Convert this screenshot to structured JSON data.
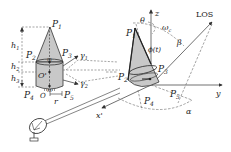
{
  "diagram": {
    "left_target": {
      "points": [
        "P1",
        "P2",
        "P3",
        "P4",
        "P5"
      ],
      "dimensions": [
        "h1",
        "h2",
        "h3",
        "r"
      ],
      "centers": [
        "O'",
        "O"
      ],
      "markers": [
        "m",
        "m"
      ],
      "scatter_directions": [
        "γ1",
        "γ2"
      ]
    },
    "right_target": {
      "points": [
        "P1",
        "P2",
        "P3",
        "P4",
        "P5"
      ],
      "angles": [
        "θ",
        "ω_c",
        "φ(t)",
        "β",
        "α"
      ],
      "axes": [
        "z",
        "y",
        "x'"
      ],
      "los_label": "LOS"
    },
    "labels": {
      "P1": "P",
      "P1_sub": "1",
      "P2": "P",
      "P2_sub": "2",
      "P3": "P",
      "P3_sub": "3",
      "P4": "P",
      "P4_sub": "4",
      "P5": "P",
      "P5_sub": "5",
      "h": "h",
      "h1_sub": "1",
      "h2_sub": "2",
      "h3_sub": "3",
      "r": "r",
      "O_prime": "O'",
      "O": "O",
      "m": "m",
      "gamma": "γ",
      "gamma1_sub": "1",
      "gamma2_sub": "2",
      "theta": "θ",
      "omega": "ω",
      "omega_sub": "c",
      "phi": "ϕ(t)",
      "beta": "β",
      "alpha": "α",
      "z": "z",
      "y": "y",
      "x_prime": "x'",
      "los": "LOS"
    },
    "colors": {
      "fill": "#c8c8c8",
      "stroke": "#333333",
      "dash": "#555555"
    }
  }
}
